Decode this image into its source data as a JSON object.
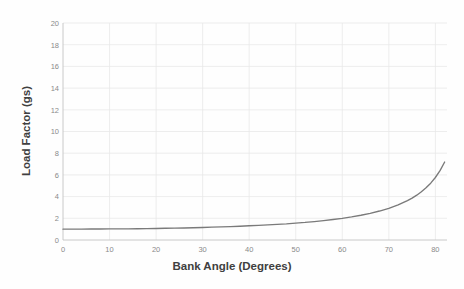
{
  "chart_data": {
    "type": "line",
    "title": "",
    "xlabel": "Bank Angle (Degrees)",
    "ylabel": "Load Factor (gs)",
    "xlim": [
      0,
      82.5
    ],
    "ylim": [
      0,
      20
    ],
    "xticks": [
      0,
      10,
      20,
      30,
      40,
      50,
      60,
      70,
      80
    ],
    "yticks": [
      0,
      2,
      4,
      6,
      8,
      10,
      12,
      14,
      16,
      18,
      20
    ],
    "grid": true,
    "legend": "none",
    "formula": "n = 1 / cos(bank angle)",
    "series": [
      {
        "name": "Load Factor",
        "color": "#7a7a7a",
        "x": [
          0,
          2,
          4,
          6,
          8,
          10,
          12,
          14,
          16,
          18,
          20,
          22,
          24,
          26,
          28,
          30,
          32,
          34,
          36,
          38,
          40,
          42,
          44,
          46,
          48,
          50,
          52,
          54,
          56,
          58,
          60,
          62,
          64,
          66,
          68,
          70,
          72,
          74,
          75,
          76,
          77,
          78,
          79,
          80,
          81,
          82,
          83,
          84,
          85,
          86,
          86.5,
          87,
          87.1
        ],
        "values": [
          1.0,
          1.0,
          1.0,
          1.01,
          1.01,
          1.02,
          1.02,
          1.03,
          1.04,
          1.05,
          1.06,
          1.08,
          1.09,
          1.11,
          1.13,
          1.15,
          1.18,
          1.21,
          1.24,
          1.27,
          1.31,
          1.35,
          1.39,
          1.44,
          1.49,
          1.56,
          1.62,
          1.7,
          1.79,
          1.89,
          2.0,
          2.13,
          2.28,
          2.46,
          2.67,
          2.92,
          3.24,
          3.63,
          3.86,
          4.13,
          4.45,
          4.81,
          5.24,
          5.76,
          6.39,
          7.19,
          8.21,
          9.57,
          11.47,
          14.34,
          16.38,
          19.11,
          19.95
        ]
      }
    ],
    "axis_tick_labels": {
      "x": [
        "0",
        "10",
        "20",
        "30",
        "40",
        "50",
        "60",
        "70",
        "80"
      ],
      "y": [
        "0",
        "2",
        "4",
        "6",
        "8",
        "10",
        "12",
        "14",
        "16",
        "18",
        "20"
      ]
    },
    "colors": {
      "curve": "#7a7a7a",
      "grid": "#e8e8e8",
      "axis": "#c4c4c4",
      "tick_text": "#8a8a8a",
      "title_text": "#404040",
      "background": "#fefefe"
    }
  }
}
